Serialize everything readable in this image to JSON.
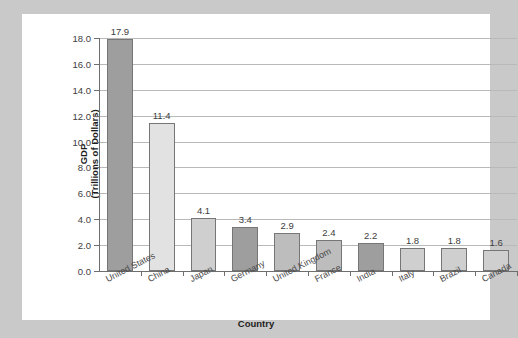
{
  "chart_data": {
    "type": "bar",
    "title": "",
    "xlabel": "Country",
    "ylabel_line1": "GDP",
    "ylabel_line2": "(Trillions of Dollars)",
    "categories": [
      "United States",
      "China",
      "Japan",
      "Germany",
      "United Kingdom",
      "France",
      "India",
      "Italy",
      "Brazil",
      "Canada"
    ],
    "values": [
      17.9,
      11.4,
      4.1,
      3.4,
      2.9,
      2.4,
      2.2,
      1.8,
      1.8,
      1.6
    ],
    "value_labels": [
      "17.9",
      "11.4",
      "4.1",
      "3.4",
      "2.9",
      "2.4",
      "2.2",
      "1.8",
      "1.8",
      "1.6"
    ],
    "bar_colors": [
      "#9e9e9e",
      "#e2e2e2",
      "#cfcfcf",
      "#9e9e9e",
      "#bdbdbd",
      "#bdbdbd",
      "#9e9e9e",
      "#cfcfcf",
      "#cfcfcf",
      "#cfcfcf"
    ],
    "ylim": [
      0.0,
      18.0
    ],
    "ytick_labels": [
      "0.0",
      "2.0",
      "4.0",
      "6.0",
      "8.0",
      "10.0",
      "12.0",
      "14.0",
      "16.0",
      "18.0"
    ],
    "ytick_values": [
      0.0,
      2.0,
      4.0,
      6.0,
      8.0,
      10.0,
      12.0,
      14.0,
      16.0,
      18.0
    ],
    "grid": true,
    "grid_color": "#b9b9b9",
    "legend": "none",
    "background": "#ffffff",
    "page_background": "#c9c9c9",
    "axis_color": "#6e6e6e"
  }
}
